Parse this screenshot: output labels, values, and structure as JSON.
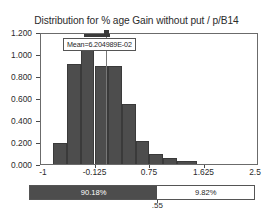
{
  "chart_data": {
    "type": "bar",
    "title": "Distribution for % age Gain without put / p/B14",
    "xlabel": "",
    "ylabel": "",
    "xlim": [
      -1,
      2.5
    ],
    "ylim": [
      0,
      1.2
    ],
    "grid": false,
    "legend": "none",
    "x_ticks": [
      {
        "label": "-1",
        "value": -1
      },
      {
        "label": "-0.125",
        "value": -0.125
      },
      {
        "label": "0.75",
        "value": 0.75
      },
      {
        "label": "1.625",
        "value": 1.625
      },
      {
        "label": "2.5",
        "value": 2.5
      }
    ],
    "y_ticks": [
      {
        "label": "0.000",
        "value": 0
      },
      {
        "label": "0.200",
        "value": 0.2
      },
      {
        "label": "0.400",
        "value": 0.4
      },
      {
        "label": "0.600",
        "value": 0.6
      },
      {
        "label": "0.800",
        "value": 0.8
      },
      {
        "label": "1.000",
        "value": 1.0
      },
      {
        "label": "1.200",
        "value": 1.2
      }
    ],
    "bins": [
      {
        "x0": -0.785,
        "x1": -0.565,
        "value": 0.195
      },
      {
        "x0": -0.565,
        "x1": -0.345,
        "value": 0.905
      },
      {
        "x0": -0.345,
        "x1": -0.125,
        "value": 1.125
      },
      {
        "x0": -0.125,
        "x1": 0.095,
        "value": 0.895
      },
      {
        "x0": 0.095,
        "x1": 0.315,
        "value": 0.895
      },
      {
        "x0": 0.315,
        "x1": 0.535,
        "value": 0.545
      },
      {
        "x0": 0.535,
        "x1": 0.755,
        "value": 0.205
      },
      {
        "x0": 0.755,
        "x1": 0.975,
        "value": 0.095
      },
      {
        "x0": 0.975,
        "x1": 1.195,
        "value": 0.055
      },
      {
        "x0": 1.195,
        "x1": 1.525,
        "value": 0.03
      }
    ],
    "annotations": {
      "mean_label": "Mean=6.204989E-02",
      "mean_value": 0.06204989
    }
  },
  "percent_split": {
    "left_label": "90.18%",
    "right_label": "9.82%",
    "boundary_label": ".55",
    "left_fraction": 0.5686,
    "left_color": "#4d4d4d",
    "right_color": "#ffffff"
  }
}
